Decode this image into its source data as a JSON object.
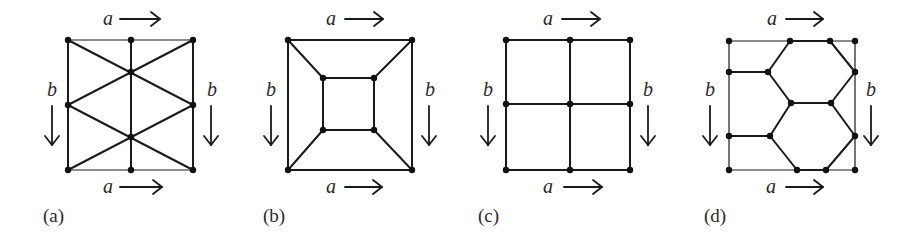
{
  "figure": {
    "colors": {
      "line": "#1a1a1a",
      "vertex": "#111111",
      "text": "#2a2a2a",
      "background": "#ffffff"
    },
    "panels": [
      {
        "id": "a",
        "caption": "(a)",
        "caption_pos": [
          43,
          222
        ],
        "square": [
          68,
          40,
          193,
          170
        ],
        "labels": {
          "top": {
            "text": "a",
            "pos": [
              103,
              25
            ],
            "arrow": [
              120,
              19,
              160,
              19
            ]
          },
          "bottom": {
            "text": "a",
            "pos": [
              103,
              193
            ],
            "arrow": [
              120,
              187,
              162,
              187
            ]
          },
          "left": {
            "text": "b",
            "pos": [
              47,
              96
            ],
            "arrow": [
              52,
              106,
              52,
              145
            ]
          },
          "right": {
            "text": "b",
            "pos": [
              207,
              96
            ],
            "arrow": [
              211,
              106,
              211,
              145
            ]
          }
        },
        "vertices": [
          [
            68,
            40
          ],
          [
            131,
            40
          ],
          [
            193,
            40
          ],
          [
            68,
            105
          ],
          [
            193,
            105
          ],
          [
            131,
            72
          ],
          [
            131,
            137
          ],
          [
            68,
            170
          ],
          [
            131,
            170
          ],
          [
            193,
            170
          ]
        ],
        "edges": [
          [
            [
              68,
              40
            ],
            [
              193,
              40
            ],
            "thin"
          ],
          [
            [
              68,
              170
            ],
            [
              193,
              170
            ],
            "thin"
          ],
          [
            [
              68,
              40
            ],
            [
              68,
              170
            ],
            "thick"
          ],
          [
            [
              193,
              40
            ],
            [
              193,
              170
            ],
            "thick"
          ],
          [
            [
              131,
              40
            ],
            [
              131,
              170
            ],
            "thick"
          ],
          [
            [
              68,
              40
            ],
            [
              193,
              105
            ],
            "thick"
          ],
          [
            [
              193,
              40
            ],
            [
              68,
              105
            ],
            "thick"
          ],
          [
            [
              68,
              105
            ],
            [
              193,
              170
            ],
            "thick"
          ],
          [
            [
              193,
              105
            ],
            [
              68,
              170
            ],
            "thick"
          ]
        ]
      },
      {
        "id": "b",
        "caption": "(b)",
        "caption_pos": [
          263,
          222
        ],
        "square": [
          288,
          40,
          412,
          170
        ],
        "labels": {
          "top": {
            "text": "a",
            "pos": [
              326,
              25
            ],
            "arrow": [
              345,
              19,
              383,
              19
            ]
          },
          "bottom": {
            "text": "a",
            "pos": [
              326,
              193
            ],
            "arrow": [
              345,
              187,
              382,
              187
            ]
          },
          "left": {
            "text": "b",
            "pos": [
              266,
              96
            ],
            "arrow": [
              271,
              106,
              271,
              145
            ]
          },
          "right": {
            "text": "b",
            "pos": [
              425,
              96
            ],
            "arrow": [
              429,
              106,
              429,
              145
            ]
          }
        },
        "vertices": [
          [
            288,
            40
          ],
          [
            412,
            40
          ],
          [
            288,
            170
          ],
          [
            412,
            170
          ],
          [
            323,
            78
          ],
          [
            374,
            78
          ],
          [
            323,
            130
          ],
          [
            374,
            130
          ]
        ],
        "edges": [
          [
            [
              288,
              40
            ],
            [
              412,
              40
            ],
            "thick"
          ],
          [
            [
              288,
              170
            ],
            [
              412,
              170
            ],
            "thick"
          ],
          [
            [
              288,
              40
            ],
            [
              288,
              170
            ],
            "thick"
          ],
          [
            [
              412,
              40
            ],
            [
              412,
              170
            ],
            "thick"
          ],
          [
            [
              323,
              78
            ],
            [
              374,
              78
            ],
            "thick"
          ],
          [
            [
              323,
              130
            ],
            [
              374,
              130
            ],
            "thick"
          ],
          [
            [
              323,
              78
            ],
            [
              323,
              130
            ],
            "thick"
          ],
          [
            [
              374,
              78
            ],
            [
              374,
              130
            ],
            "thick"
          ],
          [
            [
              288,
              40
            ],
            [
              323,
              78
            ],
            "thick"
          ],
          [
            [
              412,
              40
            ],
            [
              374,
              78
            ],
            "thick"
          ],
          [
            [
              288,
              170
            ],
            [
              323,
              130
            ],
            "thick"
          ],
          [
            [
              412,
              170
            ],
            [
              374,
              130
            ],
            "thick"
          ]
        ]
      },
      {
        "id": "c",
        "caption": "(c)",
        "caption_pos": [
          478,
          222
        ],
        "square": [
          506,
          40,
          630,
          170
        ],
        "labels": {
          "top": {
            "text": "a",
            "pos": [
              543,
              25
            ],
            "arrow": [
              562,
              19,
              600,
              19
            ]
          },
          "bottom": {
            "text": "a",
            "pos": [
              543,
              193
            ],
            "arrow": [
              564,
              187,
              602,
              187
            ]
          },
          "left": {
            "text": "b",
            "pos": [
              483,
              96
            ],
            "arrow": [
              488,
              106,
              488,
              145
            ]
          },
          "right": {
            "text": "b",
            "pos": [
              643,
              96
            ],
            "arrow": [
              648,
              106,
              648,
              145
            ]
          }
        },
        "vertices": [
          [
            506,
            40
          ],
          [
            570,
            40
          ],
          [
            630,
            40
          ],
          [
            506,
            104
          ],
          [
            570,
            104
          ],
          [
            630,
            104
          ],
          [
            506,
            170
          ],
          [
            570,
            170
          ],
          [
            630,
            170
          ]
        ],
        "edges": [
          [
            [
              506,
              40
            ],
            [
              630,
              40
            ],
            "thick"
          ],
          [
            [
              506,
              104
            ],
            [
              630,
              104
            ],
            "thick"
          ],
          [
            [
              506,
              170
            ],
            [
              630,
              170
            ],
            "thick"
          ],
          [
            [
              506,
              40
            ],
            [
              506,
              170
            ],
            "thick"
          ],
          [
            [
              570,
              40
            ],
            [
              570,
              170
            ],
            "thick"
          ],
          [
            [
              630,
              40
            ],
            [
              630,
              170
            ],
            "thick"
          ]
        ]
      },
      {
        "id": "d",
        "caption": "(d)",
        "caption_pos": [
          704,
          222
        ],
        "square": [
          729,
          41,
          855,
          170
        ],
        "labels": {
          "top": {
            "text": "a",
            "pos": [
              767,
              25
            ],
            "arrow": [
              786,
              19,
              823,
              19
            ]
          },
          "bottom": {
            "text": "a",
            "pos": [
              766,
              193
            ],
            "arrow": [
              786,
              187,
              823,
              187
            ]
          },
          "left": {
            "text": "b",
            "pos": [
              705,
              96
            ],
            "arrow": [
              710,
              106,
              710,
              145
            ]
          },
          "right": {
            "text": "b",
            "pos": [
              866,
              96
            ],
            "arrow": [
              871,
              106,
              871,
              145
            ]
          }
        },
        "vertices": [
          [
            729,
            41
          ],
          [
            790,
            41
          ],
          [
            830,
            41
          ],
          [
            855,
            41
          ],
          [
            729,
            72
          ],
          [
            768,
            72
          ],
          [
            855,
            72
          ],
          [
            791,
            103
          ],
          [
            831,
            103
          ],
          [
            729,
            136
          ],
          [
            770,
            136
          ],
          [
            855,
            136
          ],
          [
            729,
            170
          ],
          [
            797,
            170
          ],
          [
            826,
            170
          ],
          [
            855,
            170
          ]
        ],
        "edges": [
          [
            [
              729,
              41
            ],
            [
              855,
              41
            ],
            "thin"
          ],
          [
            [
              729,
              170
            ],
            [
              855,
              170
            ],
            "thin"
          ],
          [
            [
              729,
              41
            ],
            [
              729,
              170
            ],
            "thin"
          ],
          [
            [
              855,
              41
            ],
            [
              855,
              170
            ],
            "thin"
          ],
          [
            [
              790,
              41
            ],
            [
              830,
              41
            ],
            "thick"
          ],
          [
            [
              797,
              170
            ],
            [
              826,
              170
            ],
            "thick"
          ],
          [
            [
              729,
              72
            ],
            [
              768,
              72
            ],
            "thick"
          ],
          [
            [
              729,
              136
            ],
            [
              770,
              136
            ],
            "thick"
          ],
          [
            [
              768,
              72
            ],
            [
              790,
              41
            ],
            "thick"
          ],
          [
            [
              830,
              41
            ],
            [
              855,
              72
            ],
            "thick"
          ],
          [
            [
              768,
              72
            ],
            [
              791,
              103
            ],
            "thick"
          ],
          [
            [
              791,
              103
            ],
            [
              831,
              103
            ],
            "thick"
          ],
          [
            [
              831,
              103
            ],
            [
              855,
              72
            ],
            "thick"
          ],
          [
            [
              791,
              103
            ],
            [
              770,
              136
            ],
            "thick"
          ],
          [
            [
              831,
              103
            ],
            [
              855,
              136
            ],
            "thick"
          ],
          [
            [
              770,
              136
            ],
            [
              797,
              170
            ],
            "thick"
          ],
          [
            [
              855,
              136
            ],
            [
              826,
              170
            ],
            "thick"
          ]
        ]
      }
    ]
  }
}
